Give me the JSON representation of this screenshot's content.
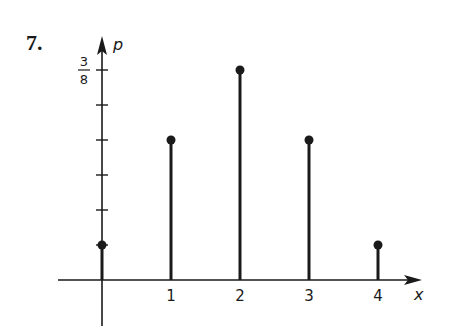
{
  "problem_number": "7.",
  "chart_data": {
    "type": "bar",
    "subtype": "stem",
    "title": "",
    "xlabel": "x",
    "ylabel": "p",
    "categories": [
      "0",
      "1",
      "2",
      "3",
      "4"
    ],
    "x": [
      0,
      1,
      2,
      3,
      4
    ],
    "values": [
      0.0625,
      0.25,
      0.375,
      0.25,
      0.0625
    ],
    "values_fraction": [
      "1/16",
      "4/16",
      "6/16",
      "4/16",
      "1/16"
    ],
    "x_tick_labels": [
      "1",
      "2",
      "3",
      "4"
    ],
    "y_tick_labels": [
      {
        "value": 0.375,
        "label_num": "3",
        "label_den": "8"
      }
    ],
    "y_ticks": [
      0.0625,
      0.125,
      0.1875,
      0.25,
      0.3125,
      0.375
    ],
    "ylim": [
      0,
      0.42
    ],
    "xlim": [
      -0.6,
      4.5
    ],
    "grid": false,
    "legend": null
  },
  "colors": {
    "ink": "#1a1a1a",
    "background": "#ffffff"
  }
}
